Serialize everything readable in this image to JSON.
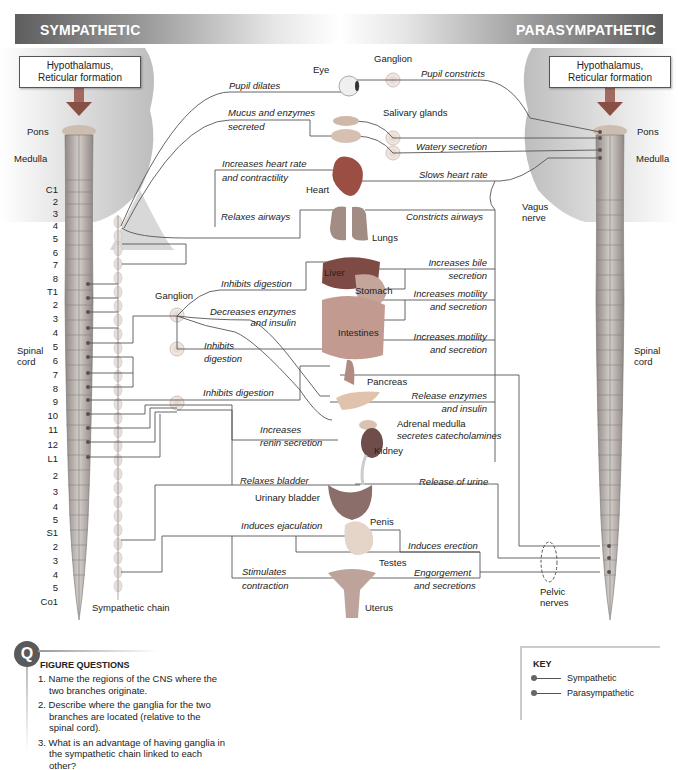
{
  "banner": {
    "left_title": "SYMPATHETIC",
    "right_title": "PARASYMPATHETIC"
  },
  "cns": {
    "left_box": [
      "Hypothalamus,",
      "Reticular formation"
    ],
    "right_box": [
      "Hypothalamus,",
      "Reticular formation"
    ],
    "pons": "Pons",
    "medulla": "Medulla",
    "spinal_cord": [
      "Spinal",
      "cord"
    ],
    "vagus_nerve": [
      "Vagus",
      "nerve"
    ],
    "pelvic_nerves": [
      "Pelvic",
      "nerves"
    ],
    "sympathetic_chain": "Sympathetic chain",
    "ganglion": "Ganglion"
  },
  "segments": {
    "cervical": [
      "C1",
      "2",
      "3",
      "4",
      "5",
      "6",
      "7",
      "8"
    ],
    "thoracic": [
      "T1",
      "2",
      "3",
      "4",
      "5",
      "6",
      "7",
      "8",
      "9",
      "10",
      "11",
      "12"
    ],
    "lumbar": [
      "L1",
      "2",
      "3",
      "4",
      "5"
    ],
    "sacral": [
      "S1",
      "2",
      "3",
      "4",
      "5"
    ],
    "coccygeal": [
      "Co1"
    ]
  },
  "organs": {
    "eye": "Eye",
    "salivary": "Salivary glands",
    "heart": "Heart",
    "lungs": "Lungs",
    "liver": "Liver",
    "stomach": "Stomach",
    "intestines": "Intestines",
    "pancreas": "Pancreas",
    "adrenal": "Adrenal medulla",
    "kidney": "Kidney",
    "bladder": "Urinary bladder",
    "penis": "Penis",
    "testes": "Testes",
    "uterus": "Uterus"
  },
  "sympathetic_effects": {
    "pupil": "Pupil dilates",
    "mucus": [
      "Mucus and enzymes",
      "secreted"
    ],
    "heart": [
      "Increases heart rate",
      "and contractility"
    ],
    "airways": "Relaxes  airways",
    "digestion1": "Inhibits digestion",
    "enzymes": [
      "Decreases enzymes",
      "and insulin"
    ],
    "digestion2": [
      "Inhibits",
      "digestion"
    ],
    "digestion3": "Inhibits digestion",
    "renin": [
      "Increases",
      "renin secretion"
    ],
    "catecholamines": "secretes catecholamines",
    "bladder": "Relaxes bladder",
    "ejaculation": "Induces ejaculation",
    "contraction": [
      "Stimulates",
      "contraction"
    ]
  },
  "parasympathetic_effects": {
    "pupil": "Pupil constricts",
    "watery": "Watery secretion",
    "heart": "Slows heart rate",
    "airways": "Constricts  airways",
    "bile": [
      "Increases bile",
      "secretion"
    ],
    "stomach": [
      "Increases motility",
      "and secretion"
    ],
    "intestines": [
      "Increases motility",
      "and secretion"
    ],
    "pancreas": [
      "Release enzymes",
      "and insulin"
    ],
    "urine": "Release of urine",
    "erection": "Induces erection",
    "engorgement": [
      "Engorgement",
      "and secretions"
    ]
  },
  "questions": {
    "badge": "Q",
    "heading": "FIGURE QUESTIONS",
    "items": [
      "1. Name the regions of the CNS where the two branches originate.",
      "2. Describe where the ganglia for the two branches are located (relative to the spinal cord).",
      "3. What is an advantage of having ganglia in the sympathetic chain linked to each other?"
    ]
  },
  "key": {
    "title": "KEY",
    "items": [
      "Sympathetic",
      "Parasympathetic"
    ]
  },
  "colors": {
    "banner_dark": "#5e5e5e",
    "line": "#555555",
    "ganglion": "#d9c9c0",
    "cord": "#b8b0ac"
  }
}
